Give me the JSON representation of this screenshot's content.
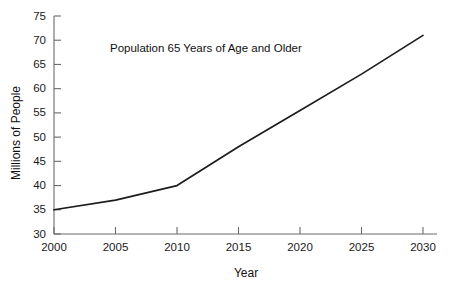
{
  "chart_data": {
    "type": "line",
    "title": "Population 65 Years of Age and Older",
    "xlabel": "Year",
    "ylabel": "Millions of People",
    "x": [
      2000,
      2010,
      2030
    ],
    "values": [
      35,
      40,
      71
    ],
    "series": [
      {
        "name": "Population 65 Years of Age and Older",
        "points": [
          {
            "x": 2000,
            "y": 35
          },
          {
            "x": 2005,
            "y": 37
          },
          {
            "x": 2010,
            "y": 40
          },
          {
            "x": 2015,
            "y": 48
          },
          {
            "x": 2020,
            "y": 55.5
          },
          {
            "x": 2025,
            "y": 63
          },
          {
            "x": 2030,
            "y": 71
          }
        ]
      }
    ],
    "xlim": [
      2000,
      2030
    ],
    "ylim": [
      30,
      75
    ],
    "xticks": [
      2000,
      2005,
      2010,
      2015,
      2020,
      2025,
      2030
    ],
    "yticks": [
      30,
      35,
      40,
      45,
      50,
      55,
      60,
      65,
      70,
      75
    ],
    "xtick_labels": [
      "2000",
      "2005",
      "2010",
      "2015",
      "2020",
      "2025",
      "2030"
    ],
    "ytick_labels": [
      "30",
      "35",
      "40",
      "45",
      "50",
      "55",
      "60",
      "65",
      "70",
      "75"
    ],
    "grid": false,
    "legend": false,
    "legend_position": "none",
    "line_color": "#1c1c1c",
    "axis_color": "#6b6b6b",
    "background_color": "#ffffff"
  }
}
